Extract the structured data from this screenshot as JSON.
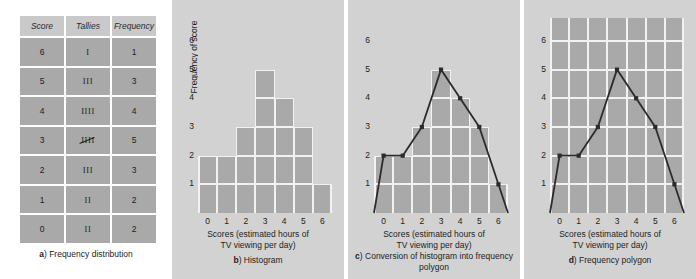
{
  "figure": {
    "panels": [
      {
        "key": "a",
        "letter": "a",
        "caption": "Frequency distribution"
      },
      {
        "key": "b",
        "letter": "b",
        "caption": "Histogram"
      },
      {
        "key": "c",
        "letter": "c",
        "caption": "Conversion of histogram into frequency polygon"
      },
      {
        "key": "d",
        "letter": "d",
        "caption": "Frequency polygon"
      }
    ]
  },
  "table": {
    "headers": [
      "Score",
      "Tallies",
      "Frequency"
    ],
    "rows": [
      {
        "score": "6",
        "tallies": "I",
        "tally_count": 1,
        "frequency": "1"
      },
      {
        "score": "5",
        "tallies": "III",
        "tally_count": 3,
        "frequency": "3"
      },
      {
        "score": "4",
        "tallies": "IIII",
        "tally_count": 4,
        "frequency": "4"
      },
      {
        "score": "3",
        "tallies": "IIII",
        "tally_count": 5,
        "frequency": "5"
      },
      {
        "score": "2",
        "tallies": "III",
        "tally_count": 3,
        "frequency": "3"
      },
      {
        "score": "1",
        "tallies": "II",
        "tally_count": 2,
        "frequency": "2"
      },
      {
        "score": "0",
        "tallies": "II",
        "tally_count": 2,
        "frequency": "2"
      }
    ]
  },
  "axes": {
    "ylabel": "Frequency of score",
    "xlabel_line1": "Scores (estimated hours of",
    "xlabel_line2": "TV viewing per day)",
    "yticks": [
      "1",
      "2",
      "3",
      "4",
      "5",
      "6"
    ],
    "xticks": [
      "0",
      "1",
      "2",
      "3",
      "4",
      "5",
      "6"
    ]
  },
  "chart_data": {
    "type": "bar",
    "categories": [
      "0",
      "1",
      "2",
      "3",
      "4",
      "5",
      "6"
    ],
    "values": [
      2,
      2,
      3,
      5,
      4,
      3,
      1
    ],
    "xlabel": "Scores (estimated hours of TV viewing per day)",
    "ylabel": "Frequency of score",
    "xlim": [
      -0.5,
      6.5
    ],
    "ylim": [
      0,
      6.8
    ],
    "grid": true,
    "legend": false,
    "panels": [
      {
        "letter": "b",
        "caption": "Histogram",
        "type": "bar",
        "categories": [
          "0",
          "1",
          "2",
          "3",
          "4",
          "5",
          "6"
        ],
        "values": [
          2,
          2,
          3,
          5,
          4,
          3,
          1
        ]
      },
      {
        "letter": "c",
        "caption": "Conversion of histogram into frequency polygon",
        "type": "bar+line",
        "categories": [
          "0",
          "1",
          "2",
          "3",
          "4",
          "5",
          "6"
        ],
        "values": [
          2,
          2,
          3,
          5,
          4,
          3,
          1
        ],
        "polygon_x": [
          -0.5,
          0,
          1,
          2,
          3,
          4,
          5,
          6,
          6.5
        ],
        "polygon_y": [
          0,
          2,
          2,
          3,
          5,
          4,
          3,
          1,
          0
        ],
        "markers_x": [
          0,
          1,
          2,
          3,
          4,
          5,
          6
        ],
        "markers_y": [
          2,
          2,
          3,
          5,
          4,
          3,
          1
        ]
      },
      {
        "letter": "d",
        "caption": "Frequency polygon",
        "type": "line",
        "polygon_x": [
          -0.5,
          0,
          1,
          2,
          3,
          4,
          5,
          6,
          6.5
        ],
        "polygon_y": [
          0,
          2,
          2,
          3,
          5,
          4,
          3,
          1,
          0
        ],
        "markers_x": [
          0,
          1,
          2,
          3,
          4,
          5,
          6
        ],
        "markers_y": [
          2,
          2,
          3,
          5,
          4,
          3,
          1
        ]
      }
    ]
  },
  "colors": {
    "page_background": "#ffffff",
    "panel_background": "#d2d2d2",
    "plot_fill": "#a9a9a9",
    "grid": "#f2f2f2",
    "line": "#2b2b2b",
    "text": "#1d1d1d",
    "table_header": "#c9c9c9",
    "table_cell": "#a9a9a9"
  }
}
